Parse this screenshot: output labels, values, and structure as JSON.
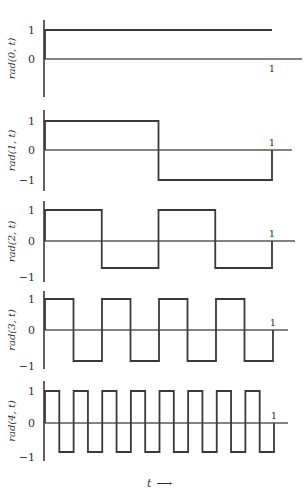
{
  "chart_data": {
    "type": "line",
    "title": "",
    "xlabel": "t",
    "xlabel_arrow": "⟶",
    "xlim": [
      0,
      1
    ],
    "x_tick_label": "1",
    "panels": [
      {
        "ylabel": "rad(0, t)",
        "yticks": [
          "1",
          "0"
        ],
        "ylim": [
          -1,
          1
        ],
        "x": [
          0,
          1
        ],
        "y": [
          1,
          1
        ],
        "segments": 1
      },
      {
        "ylabel": "rad(1, t)",
        "yticks": [
          "1",
          "0",
          "−1"
        ],
        "ylim": [
          -1,
          1
        ],
        "x": [
          0,
          0.5,
          1
        ],
        "y": [
          1,
          -1
        ],
        "segments": 2
      },
      {
        "ylabel": "rad(2, t)",
        "yticks": [
          "1",
          "0",
          "−1"
        ],
        "ylim": [
          -1,
          1
        ],
        "x": [
          0,
          0.25,
          0.5,
          0.75,
          1
        ],
        "y": [
          1,
          -1,
          1,
          -1
        ],
        "segments": 4
      },
      {
        "ylabel": "rad(3, t)",
        "yticks": [
          "1",
          "0",
          "−1"
        ],
        "ylim": [
          -1,
          1
        ],
        "x": [
          0,
          0.125,
          0.25,
          0.375,
          0.5,
          0.625,
          0.75,
          0.875,
          1
        ],
        "y": [
          1,
          -1,
          1,
          -1,
          1,
          -1,
          1,
          -1
        ],
        "segments": 8
      },
      {
        "ylabel": "rad(4, t)",
        "yticks": [
          "1",
          "0",
          "−1"
        ],
        "ylim": [
          -1,
          1
        ],
        "x": [
          0,
          0.0625,
          0.125,
          0.1875,
          0.25,
          0.3125,
          0.375,
          0.4375,
          0.5,
          0.5625,
          0.625,
          0.6875,
          0.75,
          0.8125,
          0.875,
          0.9375,
          1
        ],
        "y": [
          1,
          -1,
          1,
          -1,
          1,
          -1,
          1,
          -1,
          1,
          -1,
          1,
          -1,
          1,
          -1,
          1,
          -1
        ],
        "segments": 16
      }
    ]
  }
}
